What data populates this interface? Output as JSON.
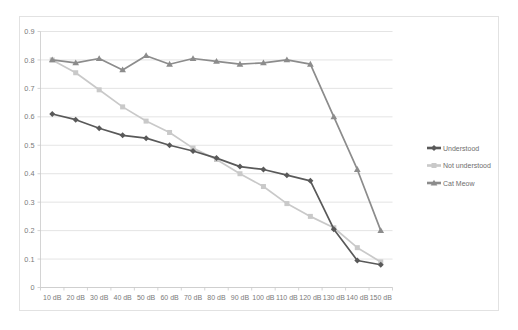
{
  "chart_data": {
    "type": "line",
    "title": "",
    "subtitle": "",
    "xlabel": "",
    "ylabel": "",
    "categories": [
      "10 dB",
      "20 dB",
      "30 dB",
      "40 dB",
      "50 dB",
      "60 dB",
      "70 dB",
      "80 dB",
      "90 dB",
      "100 dB",
      "110 dB",
      "120 dB",
      "130 dB",
      "140 dB",
      "150 dB"
    ],
    "ylim": [
      0,
      0.9
    ],
    "ytick_labels": [
      "0",
      "0.1",
      "0.2",
      "0.3",
      "0.4",
      "0.5",
      "0.6",
      "0.7",
      "0.8",
      "0.9"
    ],
    "ytick_values": [
      0,
      0.1,
      0.2,
      0.3,
      0.4,
      0.5,
      0.6,
      0.7,
      0.8,
      0.9
    ],
    "grid": "horizontal",
    "legend_position": "right",
    "series": [
      {
        "name": "Understood",
        "color": "#595959",
        "marker": "diamond",
        "values": [
          0.61,
          0.59,
          0.56,
          0.535,
          0.525,
          0.5,
          0.48,
          0.455,
          0.425,
          0.415,
          0.395,
          0.375,
          0.205,
          0.095,
          0.08
        ]
      },
      {
        "name": "Not understood",
        "color": "#c9c9c9",
        "marker": "square",
        "values": [
          0.8,
          0.755,
          0.695,
          0.635,
          0.585,
          0.545,
          0.49,
          0.45,
          0.4,
          0.355,
          0.295,
          0.25,
          0.21,
          0.14,
          0.09
        ]
      },
      {
        "name": "Cat Meow",
        "color": "#8c8c8c",
        "marker": "triangle",
        "values": [
          0.8,
          0.79,
          0.805,
          0.765,
          0.815,
          0.785,
          0.805,
          0.795,
          0.785,
          0.79,
          0.8,
          0.785,
          0.6,
          0.415,
          0.2
        ]
      }
    ]
  },
  "colors": {
    "background": "#ffffff",
    "frame_border": "#e2e2e2",
    "gridline": "#d9d9d9",
    "axis": "#c9c9c9",
    "tick_text": "#7a7a7a",
    "legend_text": "#6e6e6e"
  },
  "legend": {
    "items": [
      {
        "label": "Understood"
      },
      {
        "label": "Not understood"
      },
      {
        "label": "Cat Meow"
      }
    ]
  }
}
